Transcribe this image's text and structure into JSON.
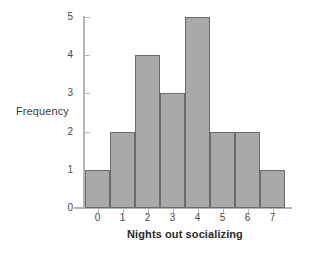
{
  "chart_data": {
    "type": "bar",
    "title": "",
    "subtitle": "",
    "xlabel": "Nights out socializing",
    "ylabel": "Frequency",
    "categories": [
      "0",
      "1",
      "2",
      "3",
      "4",
      "5",
      "6",
      "7"
    ],
    "values": [
      1,
      2,
      4,
      3,
      5,
      2,
      2,
      1
    ],
    "series": [
      {
        "name": "Frequency",
        "values": [
          1,
          2,
          4,
          3,
          5,
          2,
          2,
          1
        ]
      }
    ],
    "ylim": [
      0,
      5
    ],
    "yticks": [
      "0",
      "1",
      "2",
      "3",
      "4",
      "5"
    ],
    "xticks": [
      "0",
      "1",
      "2",
      "3",
      "4",
      "5",
      "6",
      "7"
    ],
    "grid": false,
    "legend": false,
    "legend_position": "none",
    "bar_fill_color": "#a9a9a9",
    "bar_border_color": "#6b6b6b",
    "axis_color": "#b4b4b4",
    "background_color": "#ffffff",
    "text_color": "#3b3b3b"
  }
}
